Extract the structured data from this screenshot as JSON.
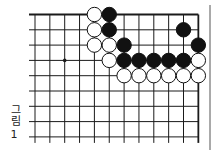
{
  "caption": {
    "text": "그림",
    "number": "1"
  },
  "board": {
    "cols": 12,
    "rows": 9,
    "x0": 35,
    "y0": 14.5,
    "dx": 14.85,
    "dy": 15.3,
    "stone_radius": 7.2,
    "star_points": [
      [
        2,
        3
      ]
    ],
    "stones": [
      {
        "c": 4,
        "r": 0,
        "color": "white"
      },
      {
        "c": 5,
        "r": 0,
        "color": "black"
      },
      {
        "c": 4,
        "r": 1,
        "color": "white"
      },
      {
        "c": 5,
        "r": 1,
        "color": "black"
      },
      {
        "c": 10,
        "r": 1,
        "color": "black"
      },
      {
        "c": 4,
        "r": 2,
        "color": "white"
      },
      {
        "c": 5,
        "r": 2,
        "color": "white"
      },
      {
        "c": 6,
        "r": 2,
        "color": "black"
      },
      {
        "c": 11,
        "r": 2,
        "color": "black"
      },
      {
        "c": 5,
        "r": 3,
        "color": "white"
      },
      {
        "c": 6,
        "r": 3,
        "color": "black"
      },
      {
        "c": 7,
        "r": 3,
        "color": "black"
      },
      {
        "c": 8,
        "r": 3,
        "color": "black"
      },
      {
        "c": 9,
        "r": 3,
        "color": "black"
      },
      {
        "c": 10,
        "r": 3,
        "color": "black"
      },
      {
        "c": 11,
        "r": 3,
        "color": "white"
      },
      {
        "c": 6,
        "r": 4,
        "color": "white"
      },
      {
        "c": 7,
        "r": 4,
        "color": "white"
      },
      {
        "c": 8,
        "r": 4,
        "color": "white"
      },
      {
        "c": 9,
        "r": 4,
        "color": "white"
      },
      {
        "c": 10,
        "r": 4,
        "color": "white"
      },
      {
        "c": 11,
        "r": 4,
        "color": "white"
      }
    ],
    "colors": {
      "line": "#1a1a1a",
      "black_stone": "#111111",
      "white_stone": "#ffffff"
    }
  }
}
